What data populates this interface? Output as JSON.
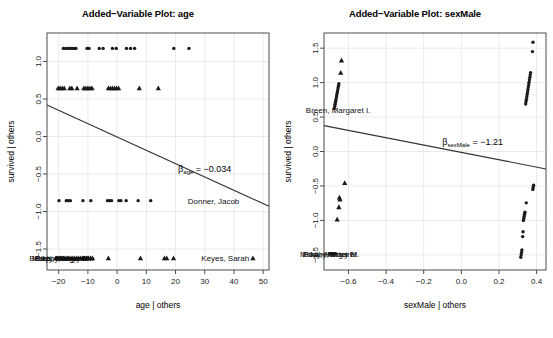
{
  "figure": {
    "width": 553,
    "height": 338,
    "background": "#ffffff",
    "panel_count": 2
  },
  "chart_data": [
    {
      "type": "scatter",
      "panel": "left",
      "title": "Added−Variable Plot: age",
      "xlabel": "age | others",
      "ylabel": "survived | others",
      "xlim": [
        -24,
        52
      ],
      "ylim": [
        -1.78,
        1.38
      ],
      "xticks": [
        -20,
        -10,
        0,
        10,
        20,
        30,
        40,
        50
      ],
      "xticklabels": [
        "−20",
        "−10",
        "0",
        "10",
        "20",
        "30",
        "40",
        "50"
      ],
      "yticks": [
        1.0,
        0.5,
        0.0,
        -0.5,
        -1.0,
        -1.5
      ],
      "yticklabels": [
        "1.0",
        "0.5",
        "0.0",
        "−0.5",
        "−1.0",
        "−1.5"
      ],
      "grid": true,
      "legend": null,
      "fit_line": {
        "x0": -24,
        "y0": 0.42,
        "x1": 52,
        "y1": -0.93,
        "slope": -0.034
      },
      "annotations": [
        {
          "text": "β",
          "sub": "age",
          "rest": " = −0.034",
          "x": 30,
          "y": -0.47
        },
        {
          "text": "Donner, Jacob",
          "x": 33,
          "y": -0.855
        },
        {
          "text": "Keyes, Sarah",
          "x": 37,
          "y": -1.62
        },
        {
          "text": "Breen, Margaret I.",
          "x": -19,
          "y": -1.62
        },
        {
          "text": "Murphy, Mary M.",
          "x": -19,
          "y": -1.62
        },
        {
          "text": "Pike, Harriet F.",
          "x": -19,
          "y": -1.62
        },
        {
          "text": "Eddy, Margaret",
          "x": -19,
          "y": -1.62
        }
      ],
      "series": [
        {
          "name": "circles-upper",
          "marker": "circle",
          "y": 1.175,
          "x": [
            -18.4,
            -17.6,
            -16.9,
            -16.2,
            -15.5,
            -14.8,
            -14.1,
            -10.3,
            -9.6,
            -6.1,
            -4.8,
            -1.6,
            -0.3,
            3.2,
            4.6,
            6.0,
            19.4,
            24.6
          ]
        },
        {
          "name": "triangles-upper",
          "marker": "triangle",
          "y": 0.645,
          "x": [
            -20.2,
            -19.5,
            -18.8,
            -18.1,
            -16.2,
            -15.5,
            -13.7,
            -11.4,
            -10.7,
            -10.0,
            -9.3,
            -8.6,
            -3.0,
            -2.3,
            -1.6,
            -0.9,
            -0.2,
            0.5,
            7.6,
            14.1
          ]
        },
        {
          "name": "circles-lower",
          "marker": "circle",
          "y": -0.855,
          "x": [
            -19.9,
            -17.4,
            -16.7,
            -16.0,
            -11.7,
            -9.0,
            -3.3,
            -2.6,
            -1.9,
            0.6,
            1.3,
            3.1,
            7.2,
            11.5
          ]
        },
        {
          "name": "triangles-lower",
          "marker": "triangle",
          "y": -1.62,
          "x": [
            -21.0,
            -20.3,
            -19.6,
            -18.9,
            -18.2,
            -17.5,
            -16.8,
            -16.1,
            -15.4,
            -14.7,
            -14.0,
            -13.3,
            -12.6,
            -11.9,
            -11.2,
            -10.5,
            -9.8,
            -9.1,
            -8.4,
            -3.0,
            8.0,
            16.2,
            17.0,
            19.3,
            46.5
          ]
        }
      ]
    },
    {
      "type": "scatter",
      "panel": "right",
      "title": "Added−Variable Plot: sexMale",
      "xlabel": "sexMale | others",
      "ylabel": "survived | others",
      "xlim": [
        -0.73,
        0.45
      ],
      "ylim": [
        -1.72,
        1.72
      ],
      "xticks": [
        -0.6,
        -0.4,
        -0.2,
        0.0,
        0.2,
        0.4
      ],
      "xticklabels": [
        "−0.6",
        "−0.4",
        "−0.2",
        "0.0",
        "0.2",
        "0.4"
      ],
      "yticks": [
        1.5,
        1.0,
        0.5,
        0.0,
        -0.5,
        -1.0,
        -1.5
      ],
      "yticklabels": [
        "1.5",
        "1.0",
        "0.5",
        "0.0",
        "−0.5",
        "−1.0",
        "−1.5"
      ],
      "grid": true,
      "legend": null,
      "fit_line": {
        "x0": -0.73,
        "y0": 0.375,
        "x1": 0.45,
        "y1": -0.253,
        "slope": -1.21
      },
      "annotations": [
        {
          "text": "β",
          "sub": "sexMale",
          "rest": " = −1.21",
          "x": 0.06,
          "y": 0.1
        },
        {
          "text": "Breen, Margaret I.",
          "x": -0.655,
          "y": 0.6
        },
        {
          "text": "Murphy, Mary M.",
          "x": -0.7,
          "y": -1.49
        },
        {
          "text": "Eddy, Margaret",
          "x": -0.7,
          "y": -1.49
        },
        {
          "text": "Pike, Harriet F.",
          "x": -0.7,
          "y": -1.49
        }
      ],
      "series": [
        {
          "name": "left-cluster-triangles",
          "marker": "triangle",
          "points": [
            [
              -0.637,
              1.325
            ],
            [
              -0.641,
              1.145
            ],
            [
              -0.62,
              -0.455
            ],
            [
              -0.648,
              -0.665
            ],
            [
              -0.645,
              -0.695
            ],
            [
              -0.651,
              -0.805
            ],
            [
              -0.66,
              -0.985
            ]
          ]
        },
        {
          "name": "left-cluster-circles",
          "marker": "circle",
          "points": [
            [
              -0.651,
              0.985
            ],
            [
              -0.653,
              0.955
            ],
            [
              -0.655,
              0.925
            ],
            [
              -0.657,
              0.895
            ],
            [
              -0.659,
              0.865
            ],
            [
              -0.661,
              0.835
            ],
            [
              -0.663,
              0.805
            ],
            [
              -0.665,
              0.775
            ],
            [
              -0.667,
              0.745
            ],
            [
              -0.669,
              0.715
            ],
            [
              -0.671,
              0.685
            ],
            [
              -0.673,
              0.655
            ],
            [
              -0.675,
              0.625
            ],
            [
              -0.7,
              -1.485
            ],
            [
              -0.694,
              -1.485
            ],
            [
              -0.688,
              -1.485
            ],
            [
              -0.682,
              -1.485
            ],
            [
              -0.676,
              -1.485
            ],
            [
              -0.67,
              -1.485
            ]
          ]
        },
        {
          "name": "right-cluster-circles",
          "marker": "circle",
          "points": [
            [
              0.381,
              1.585
            ],
            [
              0.378,
              1.45
            ],
            [
              0.368,
              1.145
            ],
            [
              0.366,
              1.11
            ],
            [
              0.364,
              1.075
            ],
            [
              0.362,
              1.04
            ],
            [
              0.36,
              1.005
            ],
            [
              0.358,
              0.97
            ],
            [
              0.356,
              0.935
            ],
            [
              0.354,
              0.9
            ],
            [
              0.352,
              0.865
            ],
            [
              0.35,
              0.83
            ],
            [
              0.348,
              0.795
            ],
            [
              0.346,
              0.76
            ],
            [
              0.344,
              0.725
            ],
            [
              0.342,
              0.69
            ],
            [
              0.384,
              -0.49
            ],
            [
              0.382,
              -0.52
            ],
            [
              0.38,
              -0.55
            ],
            [
              0.345,
              -0.745
            ],
            [
              0.338,
              -0.88
            ],
            [
              0.336,
              -0.91
            ],
            [
              0.334,
              -0.94
            ],
            [
              0.332,
              -0.97
            ],
            [
              0.33,
              -1.0
            ],
            [
              0.328,
              -1.165
            ],
            [
              0.326,
              -1.235
            ],
            [
              0.322,
              -1.43
            ],
            [
              0.32,
              -1.465
            ],
            [
              0.318,
              -1.5
            ],
            [
              0.316,
              -1.535
            ]
          ]
        }
      ]
    }
  ]
}
